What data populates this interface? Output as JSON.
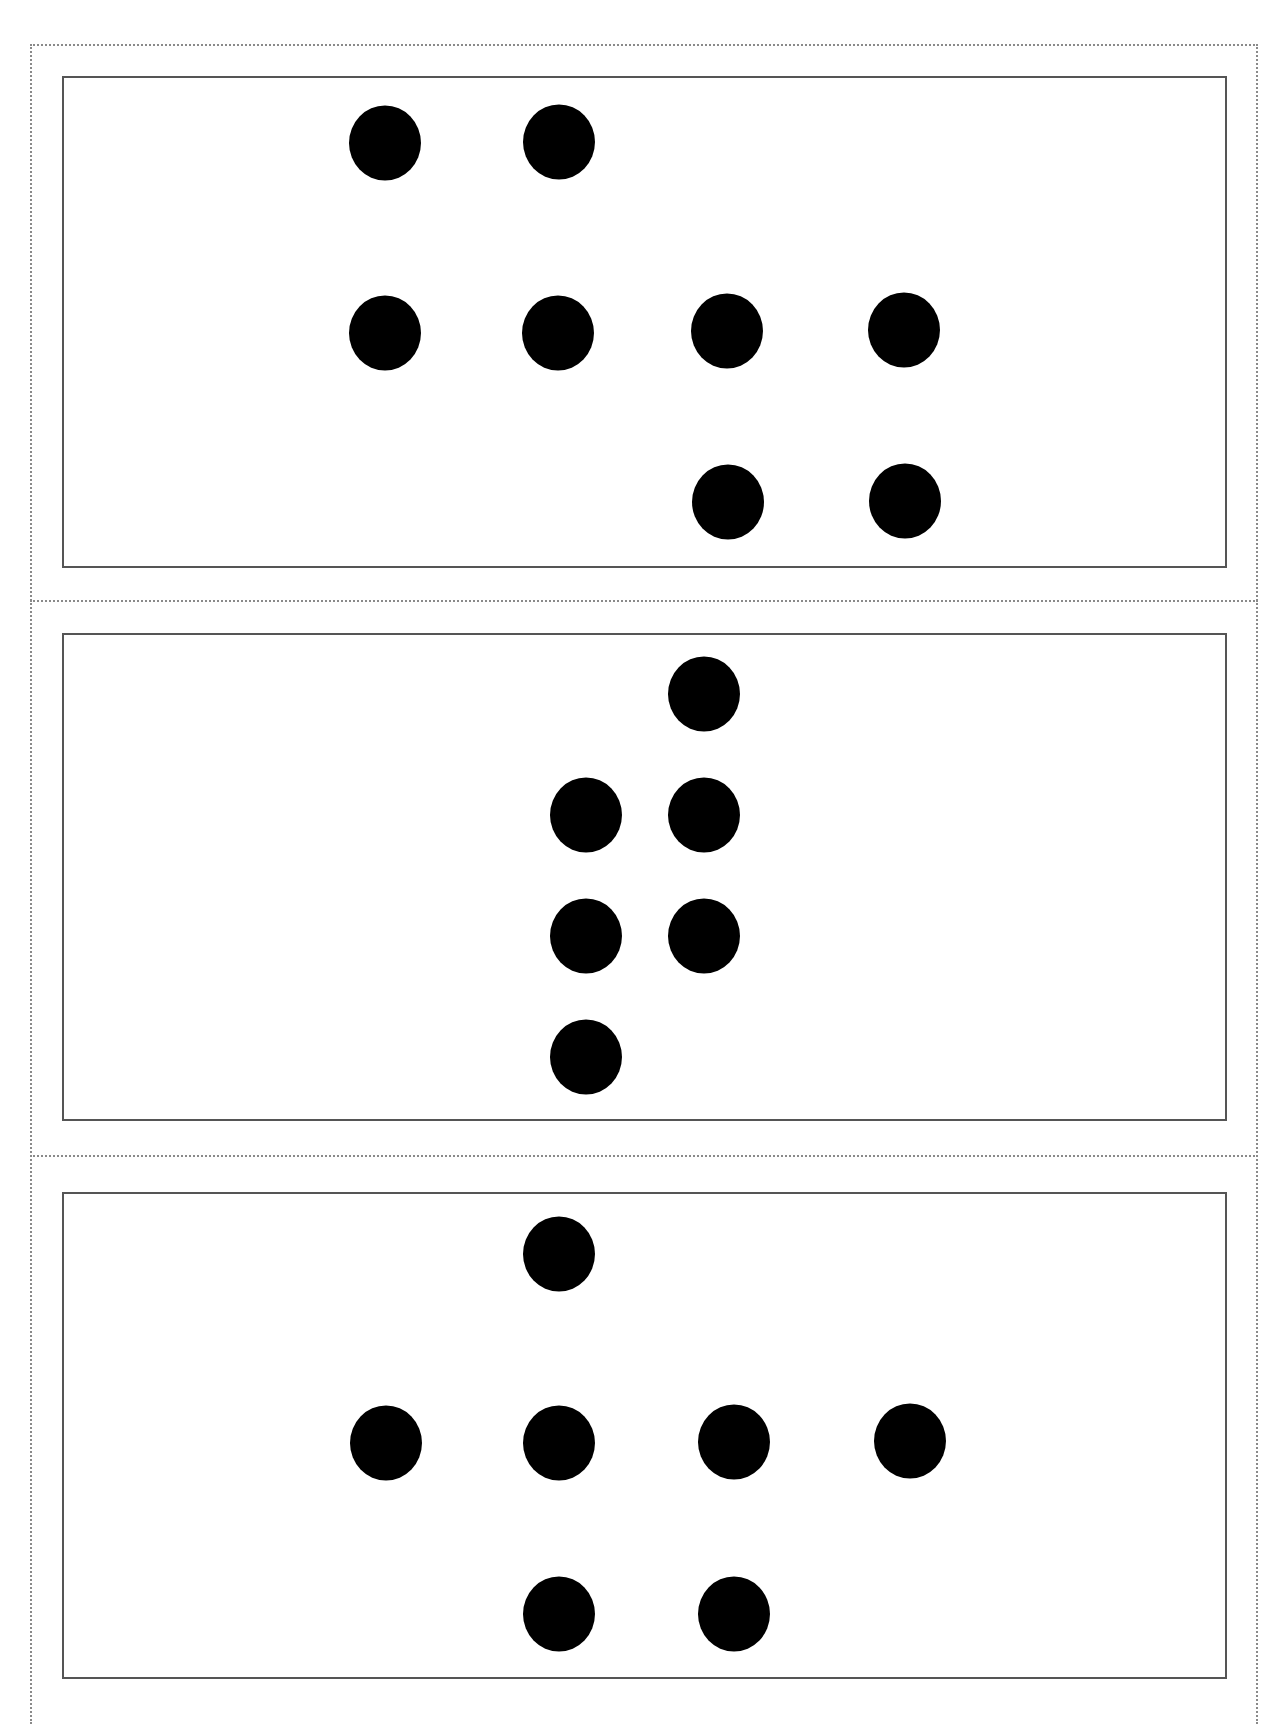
{
  "page": {
    "colors": {
      "dot": "#000000",
      "card_border": "#555555",
      "cut_line": "#8a8a8a",
      "background": "#ffffff"
    }
  },
  "cards": [
    {
      "name": "card-1",
      "dot_count": 8,
      "top": 76,
      "height": 492,
      "dots": [
        {
          "x": 383,
          "y": 141
        },
        {
          "x": 557,
          "y": 140
        },
        {
          "x": 383,
          "y": 331
        },
        {
          "x": 556,
          "y": 331
        },
        {
          "x": 725,
          "y": 329
        },
        {
          "x": 902,
          "y": 328
        },
        {
          "x": 726,
          "y": 500
        },
        {
          "x": 903,
          "y": 499
        }
      ]
    },
    {
      "name": "card-2",
      "dot_count": 6,
      "top": 633,
      "height": 488,
      "dots": [
        {
          "x": 702,
          "y": 692
        },
        {
          "x": 584,
          "y": 813
        },
        {
          "x": 702,
          "y": 813
        },
        {
          "x": 584,
          "y": 934
        },
        {
          "x": 702,
          "y": 934
        },
        {
          "x": 584,
          "y": 1055
        }
      ]
    },
    {
      "name": "card-3",
      "dot_count": 7,
      "top": 1192,
      "height": 487,
      "dots": [
        {
          "x": 557,
          "y": 1252
        },
        {
          "x": 384,
          "y": 1441
        },
        {
          "x": 557,
          "y": 1441
        },
        {
          "x": 732,
          "y": 1440
        },
        {
          "x": 908,
          "y": 1439
        },
        {
          "x": 557,
          "y": 1612
        },
        {
          "x": 732,
          "y": 1612
        }
      ]
    }
  ],
  "separators": [
    600,
    1155
  ]
}
